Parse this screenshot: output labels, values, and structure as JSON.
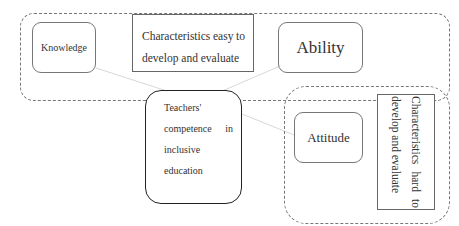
{
  "diagram": {
    "groups": [
      {
        "id": "easy-group",
        "label": "Characteristics easy to develop and evaluate"
      },
      {
        "id": "hard-group",
        "label": "Characteristics hard to develop and evaluate"
      }
    ],
    "nodes": {
      "knowledge": "Knowledge",
      "ability": "Ability",
      "attitude": "Attitude",
      "center": {
        "line1": "Teachers'",
        "line2a": "competence",
        "line2b": "in",
        "line3": "inclusive",
        "line4": "education"
      }
    },
    "easy_label": {
      "w1": "Characteristics",
      "w2": "easy",
      "w3": "to",
      "line2": "develop and evaluate"
    },
    "hard_label": {
      "w1": "Characteristics",
      "w2": "hard",
      "w3": "to",
      "line2": "develop and evaluate"
    },
    "edges": [
      {
        "from": "knowledge",
        "to": "center"
      },
      {
        "from": "ability",
        "to": "center"
      },
      {
        "from": "attitude",
        "to": "center"
      }
    ],
    "colors": {
      "line": "#dddddd",
      "border": "#777777",
      "center_border": "#222222"
    }
  }
}
